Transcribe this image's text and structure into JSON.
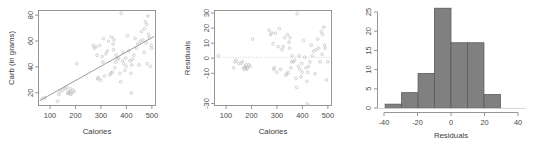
{
  "figure": {
    "background": "#ffffff",
    "point_color": "#bdbdbd",
    "line_color": "#8e8e8e",
    "bar_fill": "#808080",
    "bar_border": "#5a5a5a",
    "axis_color": "#8a8a8a"
  },
  "chart_data": [
    {
      "type": "scatter",
      "id": "carb-vs-calories",
      "title": "",
      "xlabel": "Calories",
      "ylabel": "Carb (in grams)",
      "xlim": [
        55,
        515
      ],
      "ylim": [
        14,
        82
      ],
      "xticks": [
        100,
        200,
        300,
        400,
        500
      ],
      "yticks": [
        20,
        40,
        60,
        80
      ],
      "grid": false,
      "legend": "none",
      "fit_line": {
        "x": [
          60,
          510
        ],
        "y": [
          17.5,
          63.5
        ]
      },
      "x": [
        70,
        80,
        130,
        135,
        140,
        150,
        160,
        165,
        170,
        172,
        175,
        178,
        180,
        182,
        185,
        190,
        195,
        205,
        270,
        275,
        280,
        285,
        288,
        290,
        295,
        300,
        305,
        308,
        310,
        315,
        320,
        325,
        330,
        335,
        340,
        342,
        345,
        348,
        350,
        352,
        355,
        358,
        360,
        365,
        370,
        375,
        378,
        380,
        385,
        388,
        390,
        395,
        398,
        400,
        405,
        410,
        415,
        418,
        420,
        422,
        425,
        430,
        435,
        440,
        445,
        450,
        455,
        460,
        465,
        470,
        472,
        475,
        478,
        480,
        482,
        485,
        488,
        490,
        495,
        498,
        500
      ],
      "y": [
        19,
        19.5,
        17,
        22,
        24,
        25,
        26,
        27,
        23,
        22.5,
        24,
        23,
        26,
        22,
        23,
        25,
        24,
        44,
        57,
        55,
        56,
        50,
        33,
        34,
        57,
        32,
        49,
        45,
        62,
        35,
        51,
        53,
        60,
        36,
        37,
        63,
        38,
        58,
        54,
        61,
        41,
        45,
        50,
        47,
        48,
        37,
        31,
        80,
        46,
        52,
        44,
        39,
        48,
        42,
        64,
        53,
        46,
        37,
        23,
        43,
        47,
        50,
        62,
        55,
        58,
        43,
        60,
        67,
        61,
        52,
        69,
        74,
        59,
        72,
        44,
        78,
        65,
        63,
        42,
        57,
        55
      ]
    },
    {
      "type": "scatter",
      "id": "residuals-vs-calories",
      "title": "",
      "xlabel": "Calories",
      "ylabel": "Residuals",
      "xlim": [
        55,
        515
      ],
      "ylim": [
        -32,
        31
      ],
      "xticks": [
        100,
        200,
        300,
        400,
        500
      ],
      "yticks": [
        -30,
        -10,
        0,
        10,
        20,
        30
      ],
      "ytick_labels": [
        "-30",
        "-10",
        "0",
        "10",
        "20",
        "30"
      ],
      "grid": false,
      "legend": "none",
      "reference_line": {
        "y": 0,
        "style": "dotted"
      },
      "x": [
        70,
        130,
        135,
        140,
        150,
        160,
        165,
        170,
        172,
        175,
        178,
        180,
        182,
        185,
        190,
        195,
        205,
        270,
        275,
        280,
        285,
        288,
        290,
        295,
        300,
        305,
        310,
        315,
        320,
        325,
        330,
        335,
        340,
        342,
        345,
        348,
        350,
        352,
        355,
        358,
        360,
        365,
        370,
        375,
        378,
        380,
        385,
        388,
        390,
        395,
        398,
        400,
        405,
        410,
        415,
        418,
        420,
        422,
        425,
        430,
        435,
        440,
        445,
        450,
        455,
        460,
        465,
        470,
        475,
        478,
        480,
        485,
        488,
        490,
        495,
        500
      ],
      "y": [
        1,
        -7,
        -3,
        -2,
        -4,
        -4,
        -3,
        -7,
        -8,
        -6,
        -7,
        -5,
        -8,
        -7,
        -5,
        -6,
        12,
        18,
        15,
        16,
        9,
        -8,
        -7,
        16,
        -10,
        7,
        19,
        -8,
        5,
        7,
        13,
        -12,
        -11,
        15,
        -10,
        10,
        6,
        13,
        -7,
        -3,
        1,
        -3,
        -2,
        -14,
        -20,
        29,
        -6,
        1,
        -8,
        -13,
        -4,
        -10,
        11,
        0,
        -7,
        -16,
        -31,
        -10,
        -6,
        -3,
        8,
        1,
        4,
        -11,
        5,
        12,
        6,
        -3,
        17,
        2,
        15,
        20,
        8,
        6,
        -15,
        -3
      ]
    },
    {
      "type": "bar",
      "id": "residuals-histogram",
      "title": "",
      "xlabel": "Residuals",
      "ylabel": "",
      "xlim": [
        -45,
        45
      ],
      "ylim": [
        0,
        26.5
      ],
      "xticks": [
        -40,
        -20,
        0,
        20,
        40
      ],
      "yticks": [
        0,
        5,
        10,
        15,
        20,
        25
      ],
      "grid": false,
      "legend": "none",
      "bin_width": 10,
      "bin_edges": [
        -40,
        -30,
        -20,
        -10,
        0,
        10,
        20,
        30
      ],
      "categories": [
        "-40 to -30",
        "-30 to -20",
        "-20 to -10",
        "-10 to 0",
        "0 to 10",
        "10 to 20",
        "20 to 30"
      ],
      "values": [
        1,
        4,
        9,
        26,
        17,
        17,
        3.5
      ]
    }
  ],
  "labels": {
    "scatter_xlabel": "Calories",
    "scatter_ylabel": "Carb (in grams)",
    "resid_xlabel": "Calories",
    "resid_ylabel": "Residuals",
    "hist_xlabel": "Residuals"
  }
}
